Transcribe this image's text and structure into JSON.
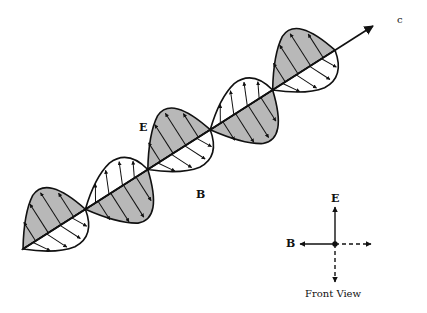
{
  "diagram": {
    "labels": {
      "propagation": "c",
      "electric_field": "E",
      "magnetic_field": "B"
    },
    "front_view": {
      "caption": "Front View",
      "e_label": "E",
      "b_label": "B"
    },
    "colors": {
      "e_field_fill": "#b8b8b8",
      "b_field_fill": "#ffffff",
      "stroke": "#111111",
      "background": "#ffffff"
    }
  }
}
